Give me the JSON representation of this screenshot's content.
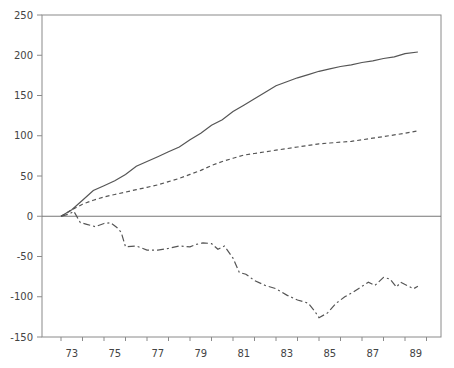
{
  "chart_data": {
    "type": "line",
    "title": "",
    "xlabel": "",
    "ylabel": "",
    "ylim": [
      -150,
      250
    ],
    "xlim": [
      72.5,
      91
    ],
    "grid": false,
    "legend": null,
    "yticks": [
      250,
      200,
      150,
      100,
      50,
      0,
      -50,
      -100,
      -150
    ],
    "xtick_labels": [
      "73",
      "75",
      "77",
      "79",
      "81",
      "83",
      "85",
      "87",
      "89"
    ],
    "series": [
      {
        "name": "solid",
        "style": "solid",
        "x": [
          73,
          73.5,
          74,
          74.5,
          75,
          75.5,
          76,
          76.5,
          77,
          77.5,
          78,
          78.5,
          79,
          79.5,
          80,
          80.5,
          81,
          81.5,
          82,
          82.5,
          83,
          83.5,
          84,
          84.5,
          85,
          85.5,
          86,
          86.5,
          87,
          87.5,
          88,
          88.5,
          89,
          89.6
        ],
        "y": [
          0,
          8,
          20,
          32,
          38,
          44,
          52,
          62,
          68,
          74,
          80,
          86,
          95,
          103,
          113,
          120,
          130,
          138,
          146,
          154,
          162,
          167,
          172,
          176,
          180,
          183,
          186,
          188,
          191,
          193,
          196,
          198,
          202,
          204
        ]
      },
      {
        "name": "dashed",
        "style": "dashed",
        "x": [
          73,
          73.5,
          74,
          74.5,
          75,
          75.5,
          76,
          76.5,
          77,
          77.5,
          78,
          78.5,
          79,
          79.5,
          80,
          80.5,
          81,
          81.5,
          82,
          82.5,
          83,
          83.5,
          84,
          84.5,
          85,
          85.5,
          86,
          86.5,
          87,
          87.5,
          88,
          88.5,
          89,
          89.6
        ],
        "y": [
          0,
          8,
          15,
          20,
          24,
          27,
          30,
          33,
          36,
          39,
          43,
          47,
          52,
          57,
          63,
          68,
          72,
          76,
          78,
          80,
          82,
          84,
          86,
          88,
          90,
          91,
          92,
          93,
          95,
          97,
          99,
          101,
          103,
          106
        ]
      },
      {
        "name": "dash-dot",
        "style": "dashdot",
        "x": [
          73,
          73.4,
          73.6,
          73.9,
          74.2,
          74.6,
          75,
          75.3,
          75.6,
          75.8,
          76,
          76.5,
          77,
          77.5,
          78,
          78.5,
          79,
          79.3,
          79.6,
          80,
          80.3,
          80.6,
          81,
          81.3,
          81.6,
          82,
          82.5,
          83,
          83.5,
          84,
          84.5,
          84.8,
          85,
          85.4,
          85.8,
          86.2,
          86.6,
          87,
          87.3,
          87.6,
          88,
          88.3,
          88.6,
          88.8,
          89.1,
          89.4,
          89.6
        ],
        "y": [
          0,
          3,
          6,
          -8,
          -10,
          -13,
          -9,
          -8,
          -14,
          -20,
          -38,
          -37,
          -42,
          -42,
          -40,
          -37,
          -38,
          -35,
          -33,
          -34,
          -41,
          -37,
          -52,
          -70,
          -72,
          -80,
          -86,
          -90,
          -98,
          -104,
          -108,
          -118,
          -126,
          -120,
          -108,
          -100,
          -94,
          -87,
          -82,
          -86,
          -76,
          -78,
          -88,
          -82,
          -86,
          -90,
          -87
        ]
      }
    ]
  },
  "axes": {
    "y_ticks": [
      "250",
      "200",
      "150",
      "100",
      "50",
      "0",
      "-50",
      "-100",
      "-150"
    ],
    "x_ticks": [
      "73",
      "75",
      "77",
      "79",
      "81",
      "83",
      "85",
      "87",
      "89"
    ]
  }
}
